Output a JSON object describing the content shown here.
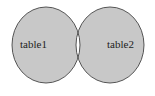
{
  "diagram": {
    "type": "venn",
    "shading": "symmetric-difference",
    "sets": [
      {
        "label": "table1"
      },
      {
        "label": "table2"
      }
    ],
    "colors": {
      "fill": "#c8c8c8",
      "intersection": "#ffffff",
      "stroke": "#444444",
      "background": "#ffffff"
    }
  }
}
